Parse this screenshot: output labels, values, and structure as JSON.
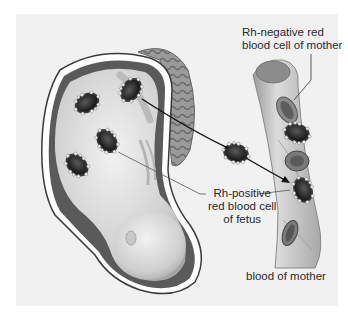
{
  "diagram": {
    "labels": {
      "rh_negative": [
        "Rh-negative red",
        "blood cell of mother"
      ],
      "rh_positive": [
        "Rh-positive",
        "red blood cell",
        "of fetus"
      ],
      "blood_of_mother": "blood of mother"
    },
    "colors": {
      "background": "#ffffff",
      "panel": "#f1f1f1",
      "uterus_wall": "#4a4a4a",
      "fetus_skin": "#d9d9d9",
      "placenta": "#8a8a8a",
      "cell_dark": "#2b2b2b",
      "antigen_dots": "#f4f4f4",
      "vessel": "#bdbdbd",
      "arrow": "#111111"
    },
    "elements": [
      {
        "id": "uterus",
        "type": "organ"
      },
      {
        "id": "fetus",
        "type": "organ"
      },
      {
        "id": "placenta",
        "type": "organ"
      },
      {
        "id": "fetal-rbc",
        "count": 4,
        "type": "cell",
        "rh": "positive"
      },
      {
        "id": "crossing-rbc",
        "count": 1,
        "type": "cell",
        "rh": "positive"
      },
      {
        "id": "blood-vessel",
        "type": "vessel"
      },
      {
        "id": "maternal-rbc",
        "count": 3,
        "type": "cell",
        "rh": "negative"
      },
      {
        "id": "fetal-rbc-in-maternal-blood",
        "count": 2,
        "type": "cell",
        "rh": "positive"
      }
    ]
  }
}
